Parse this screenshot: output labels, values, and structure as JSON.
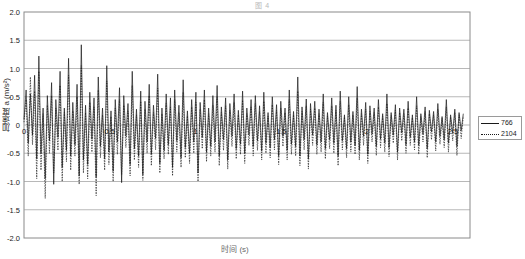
{
  "chart_data": {
    "type": "line",
    "title": "图 4",
    "xlabel": "时间 (s)",
    "ylabel": "加速度 a (m/s²)",
    "xlim": [
      0,
      2.6
    ],
    "ylim": [
      -2.0,
      2.0
    ],
    "grid": true,
    "legend_position": "right-outside",
    "y_ticks": [
      "2.0",
      "1.5",
      "1.0",
      "0.5",
      "0",
      "-0.5",
      "-1.0",
      "-1.5",
      "-2.0"
    ],
    "y_tick_values": [
      2.0,
      1.5,
      1.0,
      0.5,
      0,
      -0.5,
      -1.0,
      -1.5,
      -2.0
    ],
    "x_ticks": [
      "0",
      "0.5",
      "1",
      "1.5",
      "2",
      "2.5"
    ],
    "x_tick_values": [
      0,
      0.5,
      1,
      1.5,
      2,
      2.5
    ],
    "series": [
      {
        "name": "766",
        "style": "solid",
        "color": "#1a1a1a",
        "values": [
          0.1,
          0.62,
          -0.32,
          0.55,
          -0.18,
          0.88,
          -0.6,
          1.22,
          -0.5,
          0.3,
          -0.95,
          0.52,
          -0.28,
          0.75,
          -1.05,
          0.45,
          -0.22,
          0.95,
          -0.75,
          0.3,
          -0.45,
          1.18,
          -0.55,
          0.4,
          -0.35,
          0.72,
          -0.9,
          1.42,
          -0.62,
          0.35,
          -0.7,
          0.58,
          -0.25,
          0.48,
          -0.92,
          0.85,
          -0.38,
          0.3,
          -0.6,
          1.05,
          -0.48,
          0.25,
          -0.82,
          0.45,
          -0.3,
          0.66,
          -1.02,
          0.52,
          -0.2,
          0.38,
          -0.7,
          0.95,
          -0.42,
          0.28,
          -0.55,
          0.6,
          -0.88,
          0.42,
          -0.3,
          0.72,
          -0.52,
          0.35,
          -0.24,
          0.9,
          -0.68,
          0.3,
          -0.45,
          0.55,
          -0.35,
          0.48,
          -0.75,
          0.62,
          -0.28,
          0.35,
          -0.58,
          0.8,
          -0.4,
          0.25,
          -0.5,
          0.45,
          -0.3,
          0.58,
          -0.85,
          0.4,
          -0.22,
          0.62,
          -0.48,
          0.3,
          -0.38,
          0.52,
          -0.3,
          0.7,
          -0.55,
          0.32,
          -0.26,
          0.48,
          -0.62,
          0.38,
          -0.2,
          0.55,
          -0.42,
          0.26,
          -0.34,
          0.6,
          -0.5,
          0.3,
          -0.18,
          0.45,
          -0.38,
          0.52,
          -0.28,
          0.34,
          -0.46,
          0.58,
          -0.32,
          0.22,
          -0.4,
          0.5,
          -0.26,
          0.36,
          -0.55,
          0.42,
          -0.2,
          0.3,
          -0.45,
          0.62,
          -0.34,
          0.24,
          -0.38,
          0.85,
          -0.55,
          0.32,
          -0.26,
          0.46,
          -0.6,
          0.38,
          -0.18,
          0.42,
          -0.35,
          0.28,
          -0.3,
          0.55,
          -0.42,
          0.22,
          -0.26,
          0.48,
          -0.32,
          0.35,
          -0.55,
          0.6,
          -0.28,
          0.18,
          -0.42,
          0.5,
          -0.3,
          0.24,
          -0.36,
          0.68,
          -0.45,
          0.28,
          -0.2,
          0.4,
          -0.52,
          0.34,
          -0.16,
          0.3,
          -0.38,
          0.45,
          -0.25,
          0.2,
          -0.32,
          0.55,
          -0.4,
          0.22,
          -0.18,
          0.36,
          -0.48,
          0.3,
          -0.14,
          0.28,
          -0.35,
          0.42,
          -0.22,
          0.18,
          -0.3,
          0.5,
          -0.36,
          0.2,
          -0.16,
          0.32,
          -0.42,
          0.26,
          -0.12,
          0.24,
          -0.3,
          0.38,
          -0.2,
          0.15,
          -0.26,
          0.45,
          -0.32,
          0.18,
          -0.14,
          0.28,
          -0.38,
          0.22,
          -0.1,
          0.2
        ]
      },
      {
        "name": "2104",
        "style": "dotted",
        "color": "#1a1a1a",
        "values": [
          0.05,
          0.45,
          -0.55,
          0.85,
          -0.35,
          0.6,
          -0.95,
          0.95,
          -0.8,
          0.2,
          -1.3,
          0.35,
          -0.5,
          0.52,
          -0.85,
          0.3,
          -0.45,
          0.7,
          -1.0,
          0.22,
          -0.65,
          0.88,
          -0.8,
          0.25,
          -0.55,
          0.5,
          -1.05,
          1.05,
          -0.85,
          0.22,
          -0.95,
          0.4,
          -0.48,
          0.32,
          -1.25,
          0.62,
          -0.58,
          0.18,
          -0.8,
          0.78,
          -0.7,
          0.15,
          -1.0,
          0.3,
          -0.52,
          0.45,
          -0.88,
          0.35,
          -0.4,
          0.25,
          -0.9,
          0.7,
          -0.62,
          0.18,
          -0.75,
          0.42,
          -0.98,
          0.28,
          -0.5,
          0.52,
          -0.72,
          0.22,
          -0.44,
          0.65,
          -0.85,
          0.2,
          -0.6,
          0.38,
          -0.52,
          0.32,
          -0.9,
          0.45,
          -0.48,
          0.22,
          -0.75,
          0.58,
          -0.58,
          0.16,
          -0.68,
          0.32,
          -0.5,
          0.4,
          -1.0,
          0.28,
          -0.42,
          0.45,
          -0.65,
          0.2,
          -0.55,
          0.35,
          -0.48,
          0.5,
          -0.72,
          0.22,
          -0.45,
          0.34,
          -0.78,
          0.26,
          -0.38,
          0.4,
          -0.6,
          0.18,
          -0.52,
          0.44,
          -0.68,
          0.2,
          -0.36,
          0.32,
          -0.55,
          0.38,
          -0.45,
          0.24,
          -0.62,
          0.42,
          -0.5,
          0.16,
          -0.58,
          0.36,
          -0.44,
          0.26,
          -0.7,
          0.3,
          -0.38,
          0.22,
          -0.62,
          0.45,
          -0.52,
          0.18,
          -0.55,
          0.6,
          -0.72,
          0.24,
          -0.44,
          0.34,
          -0.78,
          0.28,
          -0.36,
          0.3,
          -0.52,
          0.2,
          -0.48,
          0.4,
          -0.6,
          0.16,
          -0.42,
          0.34,
          -0.5,
          0.26,
          -0.72,
          0.42,
          -0.44,
          0.14,
          -0.58,
          0.36,
          -0.48,
          0.18,
          -0.52,
          0.48,
          -0.62,
          0.2,
          -0.36,
          0.28,
          -0.68,
          0.24,
          -0.3,
          0.22,
          -0.54,
          0.32,
          -0.4,
          0.15,
          -0.48,
          0.38,
          -0.56,
          0.17,
          -0.32,
          0.26,
          -0.62,
          0.22,
          -0.28,
          0.2,
          -0.5,
          0.3,
          -0.36,
          0.13,
          -0.44,
          0.34,
          -0.52,
          0.15,
          -0.3,
          0.24,
          -0.58,
          0.2,
          -0.26,
          0.18,
          -0.46,
          0.28,
          -0.34,
          0.12,
          -0.4,
          0.32,
          -0.48,
          0.14,
          -0.28,
          0.22,
          -0.54,
          0.18,
          -0.24,
          0.16
        ]
      }
    ]
  },
  "legend": {
    "items": [
      {
        "label": "766",
        "style": "solid"
      },
      {
        "label": "2104",
        "style": "dotted"
      }
    ]
  }
}
